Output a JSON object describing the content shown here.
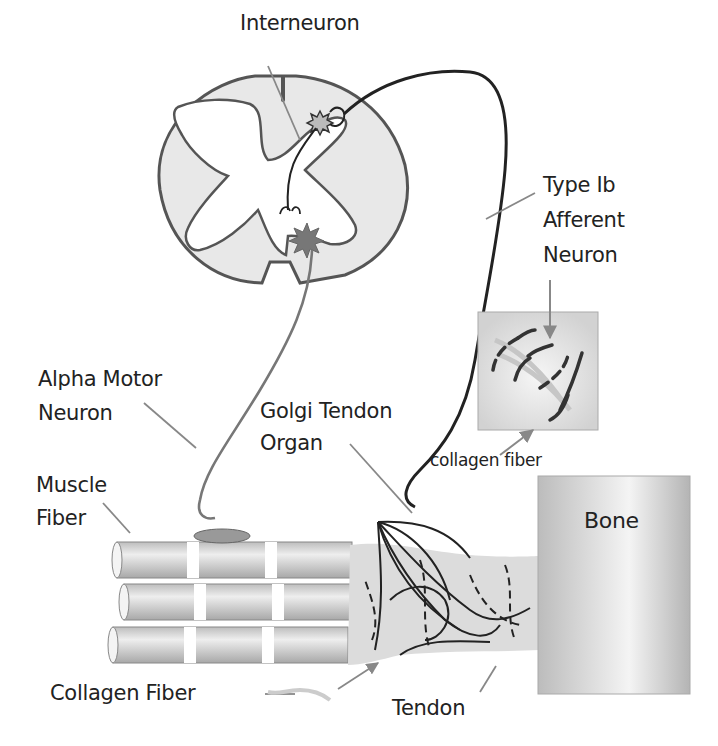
{
  "diagram": {
    "labels": {
      "interneuron": "Interneuron",
      "type_ib_line1": "Type Ib",
      "type_ib_line2": "Afferent",
      "type_ib_line3": "Neuron",
      "alpha_motor_line1": "Alpha Motor",
      "alpha_motor_line2": "Neuron",
      "golgi_line1": "Golgi Tendon",
      "golgi_line2": "Organ",
      "muscle_line1": "Muscle",
      "muscle_line2": "Fiber",
      "collagen_fiber_inset": "collagen fiber",
      "bone": "Bone",
      "collagen_fiber": "Collagen Fiber",
      "tendon": "Tendon"
    },
    "colors": {
      "outline": "#555555",
      "gray_matter_fill": "#ffffff",
      "white_matter_fill": "#e6e6e6",
      "motor_neuron": "#777777",
      "afferent_neuron": "#222222",
      "leader_line": "#888888",
      "bone_fill": "#c8c8c8",
      "tendon_fill": "#dcdcdc"
    }
  }
}
